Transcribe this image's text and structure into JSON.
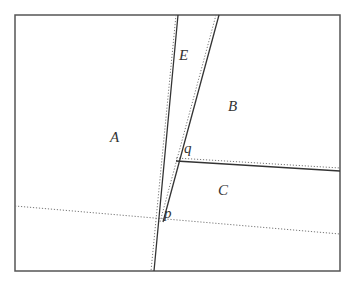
{
  "diagram": {
    "frame": {
      "x": 15,
      "y": 15,
      "width": 325,
      "height": 256,
      "stroke": "#555555"
    },
    "solid_lines": [
      {
        "id": "left-steep-line",
        "x1": 178,
        "y1": 15,
        "x2": 154,
        "y2": 271
      },
      {
        "id": "right-slanted-line",
        "x1": 219,
        "y1": 15,
        "x2": 163,
        "y2": 222
      },
      {
        "id": "q-horizontal-line",
        "x1": 176,
        "y1": 161,
        "x2": 340,
        "y2": 171
      }
    ],
    "dotted_lines": [
      {
        "id": "left-steep-dotted",
        "x1": 176,
        "y1": 15,
        "x2": 151,
        "y2": 271
      },
      {
        "id": "right-slanted-dotted",
        "x1": 216,
        "y1": 15,
        "x2": 160,
        "y2": 222
      },
      {
        "id": "q-dotted",
        "x1": 176,
        "y1": 158,
        "x2": 340,
        "y2": 168
      },
      {
        "id": "p-dotted",
        "x1": 15,
        "y1": 206,
        "x2": 340,
        "y2": 234
      }
    ],
    "labels": [
      {
        "id": "region-a",
        "text": "A",
        "x": 110,
        "y": 142
      },
      {
        "id": "region-e",
        "text": "E",
        "x": 179,
        "y": 60
      },
      {
        "id": "region-b",
        "text": "B",
        "x": 228,
        "y": 111
      },
      {
        "id": "point-q",
        "text": "q",
        "x": 184,
        "y": 153
      },
      {
        "id": "region-c",
        "text": "C",
        "x": 218,
        "y": 195
      },
      {
        "id": "point-p",
        "text": "p",
        "x": 164,
        "y": 218
      }
    ]
  }
}
